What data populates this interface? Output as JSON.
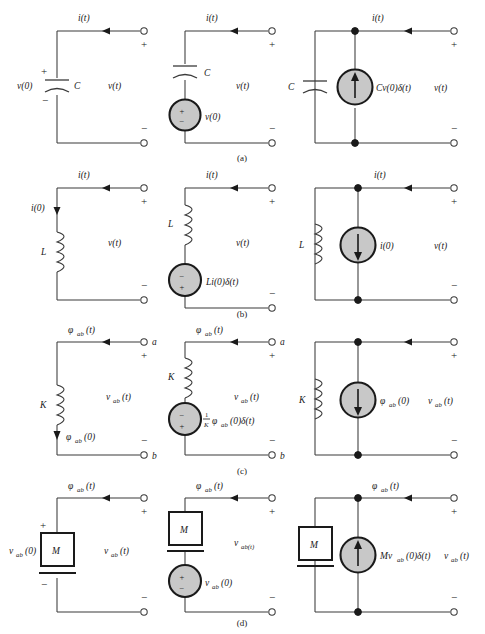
{
  "figure": {
    "background": "#ffffff",
    "line_color": "#3a3a3a",
    "source_fill": "#c8c8c8",
    "source_stroke": "#1a1a1a",
    "row_labels": [
      "(a)",
      "(b)",
      "(c)",
      "(d)"
    ]
  },
  "rows": [
    {
      "id": "row-a",
      "label": "(a)",
      "element": "capacitor",
      "circuits": [
        {
          "id": "a1",
          "kind": "element-with-initial-condition",
          "top_current_label": "i(t)",
          "element_label": "C",
          "initial_label": "v(0)",
          "across_label": "v(t)",
          "plus_terminal": "+",
          "minus_terminal": "−",
          "element_plus": "+",
          "element_minus": "−"
        },
        {
          "id": "a2",
          "kind": "series-source-equivalent",
          "top_current_label": "i(t)",
          "element_label": "C",
          "source_label": "v(0)",
          "source_top_sign": "+",
          "source_bottom_sign": "−",
          "across_label": "v(t)",
          "plus_terminal": "+",
          "minus_terminal": "−"
        },
        {
          "id": "a3",
          "kind": "parallel-source-equivalent",
          "top_current_label": "i(t)",
          "element_label": "C",
          "source_label": "Cv(0)δ(t)",
          "source_arrow": "up",
          "across_label": "v(t)",
          "plus_terminal": "+",
          "minus_terminal": "−"
        }
      ]
    },
    {
      "id": "row-b",
      "label": "(b)",
      "element": "inductor",
      "circuits": [
        {
          "id": "b1",
          "kind": "element-with-initial-condition",
          "top_current_label": "i(t)",
          "element_label": "L",
          "initial_label": "i(0)",
          "initial_arrow": "down",
          "across_label": "v(t)",
          "plus_terminal": "+",
          "minus_terminal": "−"
        },
        {
          "id": "b2",
          "kind": "series-source-equivalent",
          "top_current_label": "i(t)",
          "element_label": "L",
          "source_label": "Li(0)δ(t)",
          "source_top_sign": "−",
          "source_bottom_sign": "+",
          "across_label": "v(t)",
          "plus_terminal": "+",
          "minus_terminal": "−"
        },
        {
          "id": "b3",
          "kind": "parallel-source-equivalent",
          "top_current_label": "i(t)",
          "element_label": "L",
          "source_label": "i(0)",
          "source_arrow": "down",
          "across_label": "v(t)",
          "plus_terminal": "+",
          "minus_terminal": "−"
        }
      ]
    },
    {
      "id": "row-c",
      "label": "(c)",
      "element": "magnetic-spring-K",
      "circuits": [
        {
          "id": "c1",
          "kind": "element-with-initial-condition",
          "top_current_label": "φ",
          "top_current_sub": "ab",
          "top_current_tail": "(t)",
          "element_label": "K",
          "initial_label": "φ",
          "initial_sub": "ab",
          "initial_tail": "(0)",
          "initial_arrow": "down",
          "across_label": "v",
          "across_sub": "ab",
          "across_tail": "(t)",
          "terminal_a": "a",
          "terminal_b": "b",
          "plus_terminal": "+",
          "minus_terminal": "−"
        },
        {
          "id": "c2",
          "kind": "series-source-equivalent",
          "top_current_label": "φ",
          "top_current_sub": "ab",
          "top_current_tail": "(t)",
          "element_label": "K",
          "source_numerator": "1",
          "source_denominator": "K",
          "source_label_main": "φ",
          "source_label_sub": "ab",
          "source_label_tail": "(0)δ(t)",
          "source_top_sign": "−",
          "source_bottom_sign": "+",
          "across_label": "v",
          "across_sub": "ab",
          "across_tail": "(t)",
          "terminal_a": "a",
          "terminal_b": "b",
          "plus_terminal": "+",
          "minus_terminal": "−"
        },
        {
          "id": "c3",
          "kind": "parallel-source-equivalent",
          "element_label": "K",
          "source_label": "φ",
          "source_sub": "ab",
          "source_tail": "(0)",
          "source_arrow": "down",
          "across_label": "v",
          "across_sub": "ab",
          "across_tail": "(t)",
          "plus_terminal": "+",
          "minus_terminal": "−"
        }
      ]
    },
    {
      "id": "row-d",
      "label": "(d)",
      "element": "mass-M",
      "circuits": [
        {
          "id": "d1",
          "kind": "element-with-initial-condition",
          "top_current_label": "φ",
          "top_current_sub": "ab",
          "top_current_tail": "(t)",
          "element_label": "M",
          "initial_label": "v",
          "initial_sub": "ab",
          "initial_tail": "(0)",
          "across_label": "v",
          "across_sub": "ab",
          "across_tail": "(t)",
          "element_plus": "+",
          "element_minus": "−",
          "plus_terminal": "+",
          "minus_terminal": "−"
        },
        {
          "id": "d2",
          "kind": "series-source-equivalent",
          "top_current_label": "φ",
          "top_current_sub": "ab",
          "top_current_tail": "(t)",
          "element_label": "M",
          "source_label": "v",
          "source_sub": "ab",
          "source_tail": "(0)",
          "source_top_sign": "+",
          "source_bottom_sign": "−",
          "across_label": "v",
          "across_sub": "ab(t)",
          "across_tail": "",
          "plus_terminal": "+",
          "minus_terminal": "−"
        },
        {
          "id": "d3",
          "kind": "parallel-source-equivalent",
          "top_current_label": "φ",
          "top_current_sub": "ab",
          "top_current_tail": "(t)",
          "element_label": "M",
          "source_label": "Mv",
          "source_sub": "ab",
          "source_tail": "(0)δ(t)",
          "source_arrow": "up",
          "across_label": "v",
          "across_sub": "ab",
          "across_tail": "(t)",
          "plus_terminal": "+",
          "minus_terminal": "−"
        }
      ]
    }
  ]
}
